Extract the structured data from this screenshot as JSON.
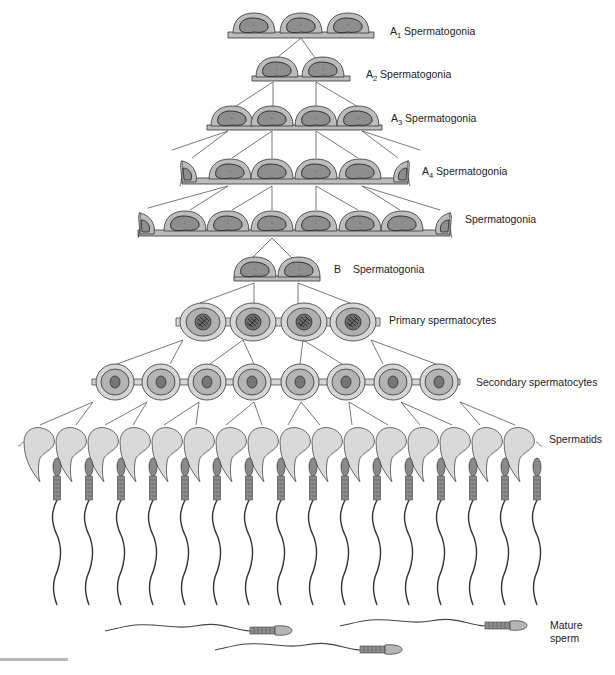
{
  "diagram": {
    "colors": {
      "cytoplasm": "#bcbcbc",
      "nucleus": "#8e8e8e",
      "outline": "#333333",
      "round_cytoplasm": "#d6d6d6",
      "spermatid": "#d9d9d9",
      "line": "#555555"
    },
    "stages": [
      {
        "id": "a1",
        "prefix": "A",
        "sub": "1",
        "suffix": " Spermatogonia",
        "cells": 3
      },
      {
        "id": "a2",
        "prefix": "A",
        "sub": "2",
        "suffix": " Spermatogonia",
        "cells": 2
      },
      {
        "id": "a3",
        "prefix": "A",
        "sub": "3",
        "suffix": " Spermatogonia",
        "cells": 4
      },
      {
        "id": "a4",
        "prefix": "A",
        "sub": "4",
        "suffix": " Spermatogonia",
        "cells": 6
      },
      {
        "id": "in",
        "prefix": "",
        "sub": "",
        "suffix": "Spermatogonia",
        "cells": 8
      },
      {
        "id": "b",
        "prefix": "B",
        "sub": "",
        "suffix": "   Spermatogonia",
        "cells": 2
      },
      {
        "id": "primary",
        "prefix": "",
        "sub": "",
        "suffix": "Primary spermatocytes",
        "cells": 4
      },
      {
        "id": "secondary",
        "prefix": "",
        "sub": "",
        "suffix": "Secondary spermatocytes",
        "cells": 8
      },
      {
        "id": "spermatids",
        "prefix": "",
        "sub": "",
        "suffix": "Spermatids",
        "cells": 16
      },
      {
        "id": "mature",
        "prefix": "",
        "sub": "",
        "suffix": "Mature sperm",
        "cells": 3
      }
    ],
    "labels": {
      "a1_prefix": "A",
      "a1_sub": "1",
      "a1_text": " Spermatogonia",
      "a2_prefix": "A",
      "a2_sub": "2",
      "a2_text": " Spermatogonia",
      "a3_prefix": "A",
      "a3_sub": "3",
      "a3_text": " Spermatogonia",
      "a4_prefix": "A",
      "a4_sub": "4",
      "a4_text": " Spermatogonia",
      "intermediate": "Spermatogonia",
      "b_prefix": "B",
      "b_text": "Spermatogonia",
      "primary": "Primary spermatocytes",
      "secondary": "Secondary spermatocytes",
      "spermatids": "Spermatids",
      "mature_line1": "Mature",
      "mature_line2": "sperm"
    }
  }
}
